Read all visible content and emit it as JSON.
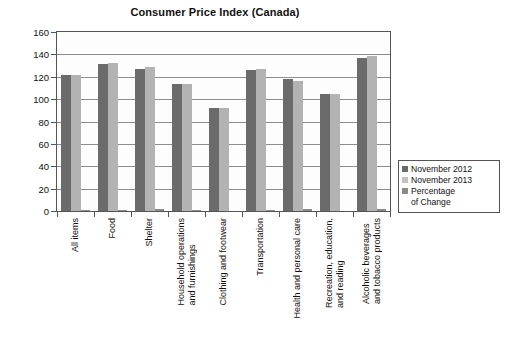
{
  "chart_data": {
    "type": "bar",
    "title": "Consumer Price Index (Canada)",
    "xlabel": "",
    "ylabel": "",
    "ylim": [
      0,
      160
    ],
    "yticks": [
      0,
      20,
      40,
      60,
      80,
      100,
      120,
      140,
      160
    ],
    "grid": true,
    "legend_position": "right",
    "categories": [
      "All items",
      "Food",
      "Shelter",
      "Household operations\nand furnishings",
      "Clothing and footwear",
      "Transportation",
      "Health and personal care",
      "Recreation, education,\nand reading",
      "Alcoholic beverages\nand tobacco products"
    ],
    "series": [
      {
        "name": "November 2012",
        "color": "#6b6b6b",
        "values": [
          121.2,
          131.0,
          126.8,
          113.2,
          92.3,
          126.1,
          118.3,
          104.8,
          136.6
        ]
      },
      {
        "name": "November 2013",
        "color": "#b3b3b3",
        "values": [
          122.0,
          132.3,
          128.5,
          113.8,
          92.0,
          126.8,
          116.6,
          104.7,
          138.4
        ]
      },
      {
        "name": "Percentage\nof Change",
        "color": "#8a8a8a",
        "values": [
          0.9,
          1.2,
          1.5,
          0.6,
          0.0,
          0.7,
          1.5,
          0.0,
          2.1
        ]
      }
    ]
  },
  "legend": {
    "entries": [
      "November 2012",
      "November 2013",
      "Percentage\nof Change"
    ]
  }
}
